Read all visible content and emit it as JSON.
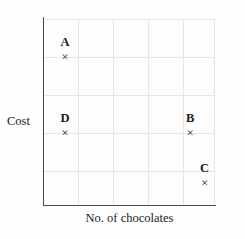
{
  "chart_data": {
    "type": "scatter",
    "title": "",
    "xlabel": "No. of chocolates",
    "ylabel": "Cost",
    "grid": true,
    "legend": "none",
    "axis_ticks": {
      "x": [],
      "y": []
    },
    "xlim": [
      0,
      5
    ],
    "ylim": [
      0,
      5
    ],
    "points": [
      {
        "label": "A",
        "marker": "×",
        "x": 0.64,
        "y": 4.2
      },
      {
        "label": "D",
        "marker": "×",
        "x": 0.64,
        "y": 2.15
      },
      {
        "label": "B",
        "marker": "×",
        "x": 4.28,
        "y": 2.15
      },
      {
        "label": "C",
        "marker": "×",
        "x": 4.7,
        "y": 0.8
      }
    ]
  },
  "axes": {
    "y_title": "Cost",
    "x_title": "No. of chocolates"
  },
  "colors": {
    "axis": "#4a4a4a",
    "grid_major": "#e6e6e6",
    "grid_minor": "#f1f1f1",
    "text": "#1b1b1b",
    "background": "#fefefe"
  }
}
